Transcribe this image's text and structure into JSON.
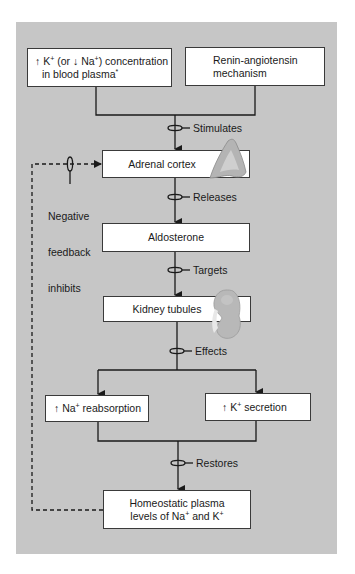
{
  "diagram": {
    "colors": {
      "panel": "#c6c6c6",
      "box_fill": "#ffffff",
      "line": "#1a1a1a",
      "organ": "#b0b0b0"
    },
    "nodes": {
      "stimulus_plasma": {
        "arrow_up": "↑",
        "k": "K",
        "k_sup": "+",
        "mid": " (or ",
        "arrow_down": "↓",
        "na": "Na",
        "na_sup": "+",
        "end": ") concentration",
        "line2": "in blood plasma",
        "footnote": "*"
      },
      "stimulus_renin": {
        "line1": "Renin-angiotensin",
        "line2": "mechanism"
      },
      "adrenal_cortex": {
        "label": "Adrenal cortex",
        "icon": "adrenal-gland-icon"
      },
      "aldosterone": {
        "label": "Aldosterone"
      },
      "kidney_tubules": {
        "label": "Kidney tubules",
        "icon": "kidney-icon"
      },
      "na_reabsorption": {
        "arrow_up": "↑",
        "ion": "Na",
        "sup": "+",
        "text": " reabsorption"
      },
      "k_secretion": {
        "arrow_up": "↑",
        "ion": "K",
        "sup": "+",
        "text": " secretion"
      },
      "homeostatic": {
        "line1": "Homeostatic plasma",
        "line2_a": "levels of Na",
        "sup_a": "+",
        "line2_b": " and K",
        "sup_b": "+"
      }
    },
    "edges": {
      "stimulates": "Stimulates",
      "releases": "Releases",
      "targets": "Targets",
      "effects": "Effects",
      "restores": "Restores"
    },
    "feedback": {
      "line1": "Negative",
      "line2": "feedback",
      "line3": "inhibits"
    }
  }
}
